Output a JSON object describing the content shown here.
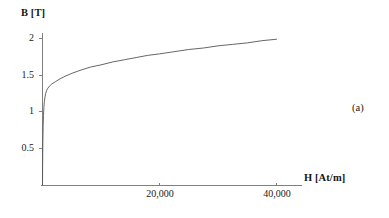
{
  "figure": {
    "panel_tag": "(a)",
    "background_color": "#ffffff",
    "line_color": "#4d4d4d",
    "axis_color": "#7a7a7a",
    "text_color": "#1a1a1a"
  },
  "chart_data": {
    "type": "line",
    "title": "",
    "subtitle": "",
    "xlabel": "H [At/m]",
    "ylabel": "B [T]",
    "xlim": [
      0,
      42000
    ],
    "ylim": [
      0,
      2.1
    ],
    "xticks": [
      20000,
      40000
    ],
    "xticklabels": [
      "20,000",
      "40,000"
    ],
    "yticks": [
      0.5,
      1,
      1.5,
      2
    ],
    "yticklabels": [
      "0.5",
      "1",
      "1.5",
      "2"
    ],
    "grid": false,
    "legend": null,
    "annotations": [
      "(a)"
    ],
    "series": [
      {
        "name": "B-H magnetization curve",
        "x": [
          0,
          20,
          60,
          110,
          170,
          240,
          320,
          420,
          540,
          700,
          900,
          1200,
          1600,
          2200,
          3000,
          4000,
          5200,
          6600,
          8200,
          10000,
          12000,
          14000,
          16000,
          18000,
          20000,
          22500,
          25000,
          27500,
          30000,
          32500,
          35000,
          37500,
          40000
        ],
        "y": [
          0,
          0.28,
          0.58,
          0.8,
          0.95,
          1.06,
          1.14,
          1.2,
          1.25,
          1.29,
          1.32,
          1.35,
          1.38,
          1.41,
          1.45,
          1.49,
          1.53,
          1.57,
          1.61,
          1.64,
          1.68,
          1.71,
          1.74,
          1.77,
          1.79,
          1.82,
          1.85,
          1.87,
          1.9,
          1.92,
          1.94,
          1.97,
          1.99
        ]
      }
    ]
  }
}
